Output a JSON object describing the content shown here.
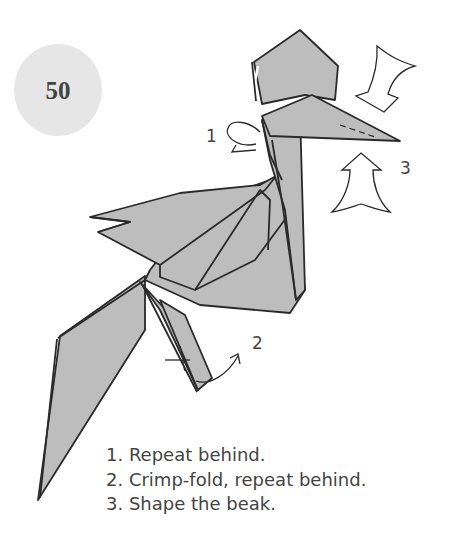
{
  "step": {
    "number": "50"
  },
  "colors": {
    "paper": "#bdbdbd",
    "line": "#2a2a2a",
    "badge": "#e6e6e6",
    "text": "#444444"
  },
  "diagram": {
    "callouts": [
      {
        "id": "1",
        "label": "1",
        "marker": "repeat-behind-arrow"
      },
      {
        "id": "2",
        "label": "2",
        "marker": "crimp-fold-arrow"
      },
      {
        "id": "3",
        "label": "3",
        "marker": "shape-beak-arrows"
      }
    ]
  },
  "instructions": [
    {
      "text": "1. Repeat behind."
    },
    {
      "text": "2. Crimp-fold, repeat behind."
    },
    {
      "text": "3. Shape the beak."
    }
  ]
}
